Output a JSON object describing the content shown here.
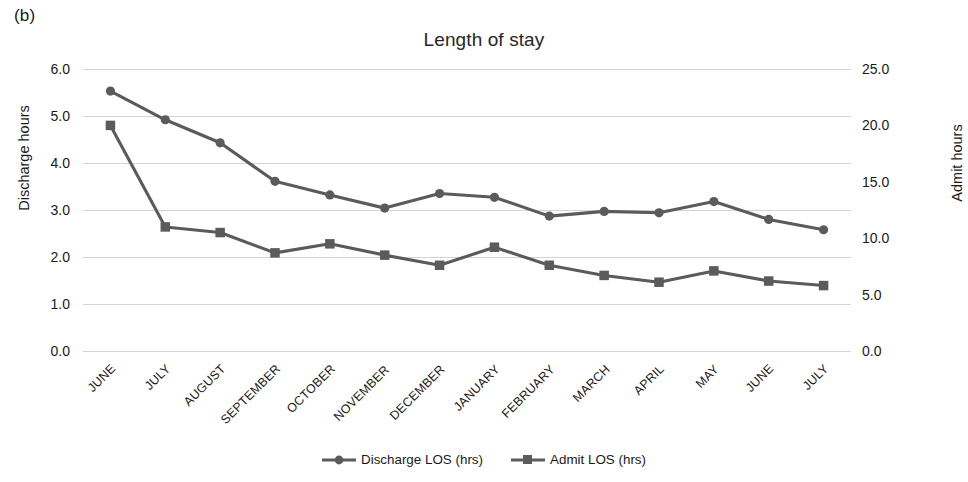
{
  "panel_label": "(b)",
  "chart_data": {
    "type": "line",
    "title": "Length of stay",
    "xlabel": "",
    "ylabel": "Discharge hours",
    "y2label": "Admit hours",
    "grid": true,
    "legend_position": "bottom",
    "categories": [
      "JUNE",
      "JULY",
      "AUGUST",
      "SEPTEMBER",
      "OCTOBER",
      "NOVEMBER",
      "DECEMBER",
      "JANUARY",
      "FEBRUARY",
      "MARCH",
      "APRIL",
      "MAY",
      "JUNE",
      "JULY"
    ],
    "ylim": [
      0.0,
      6.0
    ],
    "y_ticks": [
      "0.0",
      "1.0",
      "2.0",
      "3.0",
      "4.0",
      "5.0",
      "6.0"
    ],
    "y_tick_values": [
      0.0,
      1.0,
      2.0,
      3.0,
      4.0,
      5.0,
      6.0
    ],
    "y2lim": [
      0.0,
      25.0
    ],
    "y2_ticks": [
      "0.0",
      "5.0",
      "10.0",
      "15.0",
      "20.0",
      "25.0"
    ],
    "y2_tick_values": [
      0.0,
      5.0,
      10.0,
      15.0,
      20.0,
      25.0
    ],
    "series": [
      {
        "name": "Discharge LOS (hrs)",
        "axis": "left",
        "marker": "circle",
        "color": "#5b5b5b",
        "values": [
          5.53,
          4.92,
          4.43,
          3.61,
          3.32,
          3.04,
          3.35,
          3.27,
          2.87,
          2.97,
          2.94,
          3.18,
          2.8,
          2.58
        ]
      },
      {
        "name": "Admit LOS (hrs)",
        "axis": "right",
        "marker": "square",
        "color": "#5b5b5b",
        "values": [
          20.0,
          11.0,
          10.5,
          8.7,
          9.5,
          8.5,
          7.6,
          9.2,
          7.6,
          6.7,
          6.1,
          7.1,
          6.2,
          5.8
        ]
      }
    ]
  }
}
